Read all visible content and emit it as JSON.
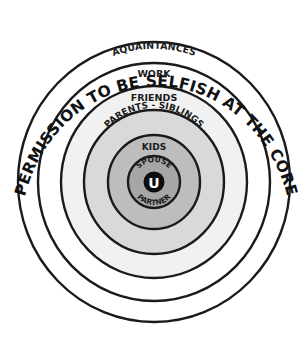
{
  "diagram": {
    "title": "PERMISSION TO BE SELFISH AT THE CORE",
    "center": {
      "x": 154,
      "y": 182
    },
    "rings": [
      {
        "id": "acquaintances",
        "label": "AQUAINTANCES",
        "fill": "#ffffff",
        "rx": 136,
        "ry": 140
      },
      {
        "id": "work",
        "label": "WORK",
        "fill": "#ffffff",
        "rx": 116,
        "ry": 119
      },
      {
        "id": "friends",
        "label": "FRIENDS",
        "fill": "#f1f1f1",
        "rx": 93,
        "ry": 96
      },
      {
        "id": "parents-siblings",
        "label": "PARENTS - SIBLINGS",
        "fill": "#d9d9d9",
        "rx": 70,
        "ry": 72
      },
      {
        "id": "kids",
        "label": "KIDS",
        "fill": "#bdbdbd",
        "rx": 46,
        "ry": 47
      },
      {
        "id": "spouse-partner",
        "label_top": "SPOUSE",
        "label_bottom": "PARTNER",
        "fill": "#a6a6a6",
        "rx": 26,
        "ry": 26
      }
    ],
    "core": {
      "label": "U",
      "fill": "#0d0d0d",
      "text_color": "#ffffff",
      "r": 10
    }
  }
}
